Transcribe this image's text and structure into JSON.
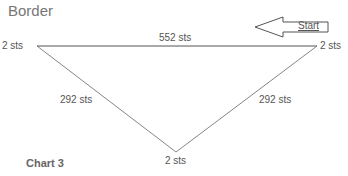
{
  "title": "Border",
  "caption": "Chart 3",
  "diagram": {
    "edges": [
      {
        "name": "top",
        "label": "552 sts"
      },
      {
        "name": "left",
        "label": "292 sts"
      },
      {
        "name": "right",
        "label": "292 sts"
      }
    ],
    "vertices": [
      {
        "name": "top-left",
        "label": "2 sts"
      },
      {
        "name": "top-right",
        "label": "2 sts"
      },
      {
        "name": "bottom",
        "label": "2 sts"
      }
    ],
    "start_arrow": {
      "label": "Start",
      "direction": "left"
    }
  },
  "colors": {
    "line": "#555555",
    "text": "#555555",
    "title": "#777777"
  }
}
